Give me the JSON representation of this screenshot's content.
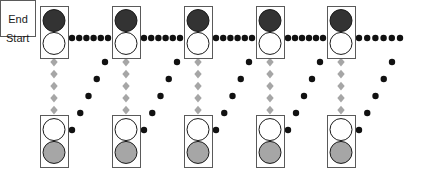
{
  "diagram": {
    "width": 441,
    "height": 173,
    "background": "#ffffff",
    "start_label": "Start",
    "end_label": "End",
    "colors": {
      "lamp_lit_top": "#333333",
      "lamp_lit_bottom": "#a6a6a6",
      "lamp_unlit": "#ffffff",
      "lamp_stroke": "#1a1a1a",
      "box_stroke": "#5a5a5a",
      "dot_black": "#111111",
      "diamond_gray": "#a6a6a6",
      "text": "#1a1a1a"
    },
    "geometry": {
      "box_width": 28,
      "box_height": 52,
      "lamp_radius": 11,
      "dot_radius": 3.2,
      "diamond_size": 7
    },
    "columns_x": [
      40,
      112,
      184,
      256,
      327
    ],
    "top_row_y": 6,
    "bottom_row_y": 115,
    "horizontal_line_y": 38,
    "diagonal_line_label": "state-transition-diagonal"
  },
  "top_lights": [
    {
      "name": "top-light-1",
      "top_lamp": "lit",
      "bottom_lamp": "unlit"
    },
    {
      "name": "top-light-2",
      "top_lamp": "lit",
      "bottom_lamp": "unlit"
    },
    {
      "name": "top-light-3",
      "top_lamp": "lit",
      "bottom_lamp": "unlit"
    },
    {
      "name": "top-light-4",
      "top_lamp": "lit",
      "bottom_lamp": "unlit"
    },
    {
      "name": "top-light-5",
      "top_lamp": "lit",
      "bottom_lamp": "unlit"
    }
  ],
  "bottom_lights": [
    {
      "name": "bottom-light-1",
      "top_lamp": "unlit",
      "bottom_lamp": "lit"
    },
    {
      "name": "bottom-light-2",
      "top_lamp": "unlit",
      "bottom_lamp": "lit"
    },
    {
      "name": "bottom-light-3",
      "top_lamp": "unlit",
      "bottom_lamp": "lit"
    },
    {
      "name": "bottom-light-4",
      "top_lamp": "unlit",
      "bottom_lamp": "lit"
    },
    {
      "name": "bottom-light-5",
      "top_lamp": "unlit",
      "bottom_lamp": "lit"
    }
  ],
  "horizontal_dot_runs": [
    {
      "from_x": 72,
      "to_x": 108,
      "y": 38,
      "count": 6
    },
    {
      "from_x": 144,
      "to_x": 180,
      "y": 38,
      "count": 6
    },
    {
      "from_x": 216,
      "to_x": 252,
      "y": 38,
      "count": 6
    },
    {
      "from_x": 288,
      "to_x": 323,
      "y": 38,
      "count": 6
    },
    {
      "from_x": 359,
      "to_x": 400,
      "y": 38,
      "count": 6
    }
  ],
  "diamond_columns": [
    {
      "x": 54,
      "from_y": 62,
      "to_y": 110,
      "count": 5
    },
    {
      "x": 126,
      "from_y": 62,
      "to_y": 110,
      "count": 5
    },
    {
      "x": 198,
      "from_y": 62,
      "to_y": 110,
      "count": 5
    },
    {
      "x": 270,
      "from_y": 62,
      "to_y": 110,
      "count": 5
    },
    {
      "x": 341,
      "from_y": 62,
      "to_y": 110,
      "count": 5
    }
  ],
  "diagonal_dot_runs": [
    {
      "name": "diagonal-1",
      "x1": 105,
      "y1": 62,
      "x2": 72,
      "y2": 130,
      "count": 5
    },
    {
      "name": "diagonal-2",
      "x1": 177,
      "y1": 62,
      "x2": 144,
      "y2": 130,
      "count": 5
    },
    {
      "name": "diagonal-3",
      "x1": 249,
      "y1": 62,
      "x2": 216,
      "y2": 130,
      "count": 5
    },
    {
      "name": "diagonal-4",
      "x1": 320,
      "y1": 62,
      "x2": 288,
      "y2": 130,
      "count": 5
    },
    {
      "name": "diagonal-5",
      "x1": 392,
      "y1": 62,
      "x2": 359,
      "y2": 130,
      "count": 5
    }
  ]
}
